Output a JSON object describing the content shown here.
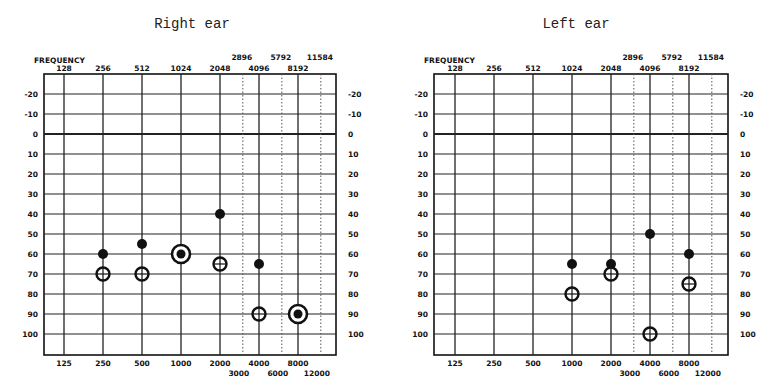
{
  "chart_data": [
    {
      "type": "scatter",
      "title": "Right ear",
      "xlabel": "FREQUENCY",
      "ylabel": "",
      "x_scale": "log2",
      "top_tick_labels_row1": [
        "2896",
        "5792",
        "11584"
      ],
      "top_tick_labels_row2": [
        "128",
        "256",
        "512",
        "1024",
        "2048",
        "4096",
        "8192"
      ],
      "bottom_tick_labels_row1": [
        "125",
        "250",
        "500",
        "1000",
        "2000",
        "4000",
        "8000"
      ],
      "bottom_tick_labels_row2": [
        "3000",
        "6000",
        "12000"
      ],
      "y_tick_labels": [
        "-20",
        "-10",
        "0",
        "10",
        "20",
        "30",
        "40",
        "50",
        "60",
        "70",
        "80",
        "90",
        "100"
      ],
      "ylim": [
        -30,
        110
      ],
      "y_inverted": true,
      "grid": true,
      "series": [
        {
          "name": "filled",
          "marker": "filled-circle",
          "points": [
            [
              250,
              60
            ],
            [
              500,
              55
            ],
            [
              2000,
              40
            ],
            [
              4000,
              65
            ]
          ]
        },
        {
          "name": "open",
          "marker": "open-circle-cross",
          "points": [
            [
              250,
              70
            ],
            [
              500,
              70
            ],
            [
              2000,
              65
            ],
            [
              4000,
              90
            ]
          ]
        },
        {
          "name": "combined",
          "marker": "circle-with-filled-dot",
          "points": [
            [
              1000,
              60
            ],
            [
              8000,
              90
            ]
          ]
        }
      ]
    },
    {
      "type": "scatter",
      "title": "Left ear",
      "xlabel": "FREQUENCY",
      "ylabel": "",
      "x_scale": "log2",
      "top_tick_labels_row1": [
        "2896",
        "5792",
        "11584"
      ],
      "top_tick_labels_row2": [
        "128",
        "256",
        "512",
        "1024",
        "2048",
        "4096",
        "8192"
      ],
      "bottom_tick_labels_row1": [
        "125",
        "250",
        "500",
        "1000",
        "2000",
        "4000",
        "8000"
      ],
      "bottom_tick_labels_row2": [
        "3000",
        "6000",
        "12000"
      ],
      "y_tick_labels": [
        "-20",
        "-10",
        "0",
        "10",
        "20",
        "30",
        "40",
        "50",
        "60",
        "70",
        "80",
        "90",
        "100"
      ],
      "ylim": [
        -30,
        110
      ],
      "y_inverted": true,
      "grid": true,
      "series": [
        {
          "name": "filled",
          "marker": "filled-circle",
          "points": [
            [
              1000,
              65
            ],
            [
              2000,
              65
            ],
            [
              4000,
              50
            ],
            [
              8000,
              60
            ]
          ]
        },
        {
          "name": "open",
          "marker": "open-circle-cross",
          "points": [
            [
              1000,
              80
            ],
            [
              2000,
              70
            ],
            [
              4000,
              100
            ],
            [
              8000,
              75
            ]
          ]
        }
      ]
    }
  ],
  "panels": {
    "right": {
      "title": "Right ear"
    },
    "left": {
      "title": "Left ear"
    }
  }
}
